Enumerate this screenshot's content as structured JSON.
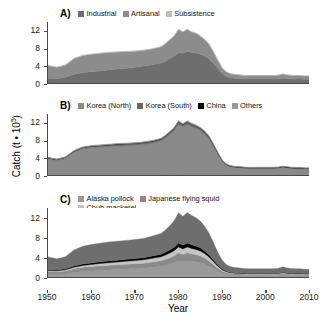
{
  "chart_data": {
    "type": "area",
    "title": "",
    "xlabel": "Year",
    "ylabel": "Catch (t • 10⁵)",
    "ylabel_prefix": "Catch (t • 10",
    "ylabel_exponent": "5",
    "ylabel_suffix": ")",
    "xlim": [
      1950,
      2010
    ],
    "ylim": [
      0,
      14
    ],
    "yticks": [
      0,
      4,
      8,
      12
    ],
    "xticks": [
      1950,
      1960,
      1970,
      1980,
      1990,
      2000,
      2010
    ],
    "grid": false,
    "legend_position": "top-inside",
    "stacked": true,
    "x": [
      1950,
      1952,
      1954,
      1956,
      1958,
      1960,
      1962,
      1964,
      1966,
      1968,
      1970,
      1972,
      1974,
      1976,
      1977,
      1978,
      1979,
      1980,
      1981,
      1982,
      1983,
      1984,
      1985,
      1986,
      1987,
      1988,
      1989,
      1990,
      1991,
      1992,
      1993,
      1994,
      1995,
      1996,
      1997,
      1998,
      1999,
      2000,
      2001,
      2002,
      2003,
      2004,
      2005,
      2006,
      2007,
      2008,
      2009,
      2010
    ],
    "panels": [
      {
        "letter": "A)",
        "legend": [
          {
            "label": "Industrial",
            "color": "#6e6e6e"
          },
          {
            "label": "Artisanal",
            "color": "#8c8c8c"
          },
          {
            "label": "Subsistence",
            "color": "#c0c0c0"
          }
        ],
        "series": [
          {
            "name": "Industrial",
            "color": "#6e6e6e",
            "values": [
              1.1,
              1.0,
              1.3,
              2.0,
              2.4,
              2.6,
              2.8,
              3.0,
              3.2,
              3.4,
              3.6,
              3.9,
              4.2,
              4.6,
              5.0,
              5.6,
              6.2,
              7.0,
              6.8,
              7.3,
              7.0,
              6.9,
              6.6,
              6.2,
              5.6,
              4.6,
              3.4,
              2.2,
              1.5,
              1.2,
              1.1,
              1.0,
              0.95,
              0.9,
              0.9,
              0.9,
              0.9,
              0.9,
              0.9,
              0.9,
              0.95,
              1.1,
              1.0,
              0.95,
              0.9,
              0.9,
              0.85,
              0.85
            ]
          },
          {
            "name": "Artisanal",
            "color": "#8c8c8c",
            "values": [
              2.9,
              2.6,
              2.8,
              3.6,
              3.9,
              4.0,
              4.0,
              4.0,
              3.9,
              3.8,
              3.7,
              3.6,
              3.6,
              3.7,
              4.0,
              4.3,
              4.6,
              5.3,
              4.9,
              5.0,
              4.7,
              4.5,
              4.2,
              3.8,
              3.3,
              2.6,
              1.9,
              1.3,
              1.0,
              0.9,
              0.85,
              0.85,
              0.8,
              0.8,
              0.8,
              0.8,
              0.8,
              0.8,
              0.8,
              0.8,
              0.85,
              0.95,
              0.85,
              0.8,
              0.8,
              0.8,
              0.75,
              0.75
            ]
          },
          {
            "name": "Subsistence",
            "color": "#c0c0c0",
            "values": [
              0.08,
              0.08,
              0.08,
              0.08,
              0.08,
              0.08,
              0.08,
              0.08,
              0.08,
              0.08,
              0.08,
              0.08,
              0.08,
              0.08,
              0.08,
              0.08,
              0.08,
              0.08,
              0.08,
              0.08,
              0.08,
              0.08,
              0.08,
              0.08,
              0.08,
              0.08,
              0.07,
              0.06,
              0.05,
              0.05,
              0.05,
              0.05,
              0.05,
              0.05,
              0.05,
              0.05,
              0.05,
              0.05,
              0.05,
              0.05,
              0.05,
              0.05,
              0.05,
              0.05,
              0.05,
              0.05,
              0.05,
              0.05
            ]
          }
        ]
      },
      {
        "letter": "B)",
        "legend": [
          {
            "label": "Korea (North)",
            "color": "#8a8a8a"
          },
          {
            "label": "Korea (South)",
            "color": "#6a6a6a"
          },
          {
            "label": "China",
            "color": "#000000"
          },
          {
            "label": "Others",
            "color": "#9a9a9a"
          }
        ],
        "series": [
          {
            "name": "Korea (North)",
            "color": "#8a8a8a",
            "values": [
              3.7,
              3.3,
              3.8,
              5.2,
              6.0,
              6.3,
              6.4,
              6.5,
              6.6,
              6.7,
              6.8,
              7.0,
              7.3,
              7.8,
              8.5,
              9.3,
              10.1,
              11.6,
              11.0,
              11.6,
              11.1,
              10.7,
              10.2,
              9.4,
              8.3,
              6.6,
              4.8,
              3.1,
              2.2,
              1.8,
              1.65,
              1.6,
              1.5,
              1.45,
              1.45,
              1.45,
              1.45,
              1.45,
              1.45,
              1.45,
              1.5,
              1.7,
              1.55,
              1.45,
              1.4,
              1.4,
              1.3,
              1.3
            ]
          },
          {
            "name": "Korea (South)",
            "color": "#6a6a6a",
            "values": [
              0.25,
              0.25,
              0.25,
              0.3,
              0.3,
              0.3,
              0.35,
              0.4,
              0.45,
              0.45,
              0.45,
              0.45,
              0.45,
              0.45,
              0.45,
              0.5,
              0.6,
              0.6,
              0.55,
              0.6,
              0.55,
              0.55,
              0.5,
              0.5,
              0.45,
              0.4,
              0.3,
              0.25,
              0.2,
              0.2,
              0.2,
              0.2,
              0.2,
              0.2,
              0.2,
              0.2,
              0.2,
              0.2,
              0.2,
              0.2,
              0.2,
              0.2,
              0.2,
              0.2,
              0.2,
              0.2,
              0.2,
              0.2
            ]
          },
          {
            "name": "China",
            "color": "#000000",
            "values": [
              0.03,
              0.03,
              0.03,
              0.03,
              0.04,
              0.04,
              0.04,
              0.04,
              0.05,
              0.05,
              0.05,
              0.05,
              0.06,
              0.06,
              0.06,
              0.07,
              0.07,
              0.08,
              0.08,
              0.08,
              0.08,
              0.08,
              0.08,
              0.08,
              0.08,
              0.07,
              0.07,
              0.06,
              0.06,
              0.06,
              0.06,
              0.06,
              0.06,
              0.06,
              0.06,
              0.06,
              0.06,
              0.06,
              0.06,
              0.06,
              0.06,
              0.06,
              0.06,
              0.06,
              0.06,
              0.06,
              0.06,
              0.06
            ]
          },
          {
            "name": "Others",
            "color": "#9a9a9a",
            "values": [
              0.1,
              0.1,
              0.12,
              0.15,
              0.15,
              0.15,
              0.15,
              0.15,
              0.15,
              0.15,
              0.15,
              0.15,
              0.15,
              0.15,
              0.15,
              0.15,
              0.15,
              0.2,
              0.2,
              0.2,
              0.2,
              0.2,
              0.2,
              0.18,
              0.15,
              0.12,
              0.1,
              0.1,
              0.1,
              0.1,
              0.1,
              0.1,
              0.1,
              0.1,
              0.1,
              0.1,
              0.1,
              0.1,
              0.1,
              0.1,
              0.1,
              0.1,
              0.1,
              0.1,
              0.1,
              0.1,
              0.1,
              0.1
            ]
          }
        ]
      },
      {
        "letter": "C)",
        "legend": [
          {
            "label": "Alaska pollock",
            "color": "#9a9a9a"
          },
          {
            "label": "Japanese flying squid",
            "color": "#8a8a8a"
          },
          {
            "label": "Chub mackerel",
            "color": "#c4c4c4"
          },
          {
            "label": "Pacific herring",
            "color": "#000000"
          },
          {
            "label": "Others",
            "color": "#6e6e6e"
          }
        ],
        "series": [
          {
            "name": "Alaska pollock",
            "color": "#9a9a9a",
            "values": [
              0.5,
              0.5,
              0.6,
              0.9,
              1.1,
              1.2,
              1.3,
              1.4,
              1.5,
              1.6,
              1.7,
              1.8,
              2.0,
              2.2,
              2.4,
              2.6,
              2.9,
              3.3,
              3.1,
              3.3,
              3.2,
              3.1,
              2.9,
              2.6,
              2.2,
              1.7,
              1.2,
              0.8,
              0.55,
              0.45,
              0.4,
              0.4,
              0.38,
              0.36,
              0.36,
              0.36,
              0.36,
              0.36,
              0.36,
              0.36,
              0.38,
              0.45,
              0.4,
              0.36,
              0.35,
              0.35,
              0.33,
              0.33
            ]
          },
          {
            "name": "Japanese flying squid",
            "color": "#8a8a8a",
            "values": [
              0.6,
              0.55,
              0.6,
              0.8,
              0.9,
              0.95,
              1.0,
              1.0,
              1.0,
              1.0,
              1.0,
              1.0,
              1.05,
              1.1,
              1.2,
              1.3,
              1.4,
              1.6,
              1.5,
              1.6,
              1.5,
              1.45,
              1.4,
              1.25,
              1.1,
              0.85,
              0.6,
              0.4,
              0.3,
              0.25,
              0.22,
              0.22,
              0.2,
              0.2,
              0.2,
              0.2,
              0.2,
              0.2,
              0.2,
              0.2,
              0.22,
              0.25,
              0.22,
              0.2,
              0.2,
              0.2,
              0.18,
              0.18
            ]
          },
          {
            "name": "Chub mackerel",
            "color": "#c4c4c4",
            "values": [
              0.2,
              0.2,
              0.25,
              0.3,
              0.35,
              0.4,
              0.45,
              0.5,
              0.55,
              0.6,
              0.65,
              0.7,
              0.75,
              0.8,
              0.85,
              0.95,
              1.05,
              1.2,
              1.1,
              1.2,
              1.1,
              1.05,
              1.0,
              0.9,
              0.75,
              0.6,
              0.42,
              0.28,
              0.2,
              0.16,
              0.15,
              0.14,
              0.13,
              0.13,
              0.13,
              0.13,
              0.13,
              0.13,
              0.13,
              0.13,
              0.14,
              0.16,
              0.14,
              0.13,
              0.12,
              0.12,
              0.12,
              0.12
            ]
          },
          {
            "name": "Pacific herring",
            "color": "#000000",
            "values": [
              0.18,
              0.18,
              0.2,
              0.25,
              0.28,
              0.3,
              0.32,
              0.34,
              0.36,
              0.38,
              0.4,
              0.42,
              0.45,
              0.5,
              0.55,
              0.62,
              0.7,
              0.8,
              0.72,
              0.78,
              0.72,
              0.68,
              0.62,
              0.55,
              0.46,
              0.36,
              0.26,
              0.18,
              0.13,
              0.1,
              0.09,
              0.09,
              0.08,
              0.08,
              0.08,
              0.08,
              0.08,
              0.08,
              0.08,
              0.08,
              0.09,
              0.1,
              0.09,
              0.08,
              0.08,
              0.08,
              0.07,
              0.07
            ]
          },
          {
            "name": "Others",
            "color": "#6e6e6e",
            "values": [
              2.6,
              2.25,
              2.45,
              3.25,
              3.6,
              3.75,
              3.8,
              3.85,
              3.85,
              3.85,
              3.85,
              3.9,
              4.05,
              4.25,
              4.55,
              4.95,
              5.35,
              6.15,
              5.85,
              6.2,
              5.95,
              5.75,
              5.45,
              5.0,
              4.4,
              3.55,
              2.6,
              1.8,
              1.3,
              1.1,
              1.05,
              1.0,
              0.95,
              0.9,
              0.9,
              0.9,
              0.9,
              0.9,
              0.9,
              0.9,
              0.95,
              1.1,
              1.0,
              0.95,
              0.9,
              0.9,
              0.85,
              0.85
            ]
          }
        ]
      }
    ]
  }
}
